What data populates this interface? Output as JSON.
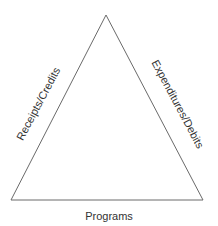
{
  "diagram": {
    "shape": "triangle",
    "stroke_color": "#666666",
    "vertices": {
      "apex": [
        106,
        15
      ],
      "bottom_left": [
        11,
        200
      ],
      "bottom_right": [
        203,
        200
      ]
    },
    "labels": {
      "left_side": "Receipts/Credits",
      "right_side": "Expenditures/Debits",
      "bottom_side": "Programs"
    }
  }
}
